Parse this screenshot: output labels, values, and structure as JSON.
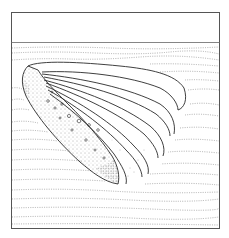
{
  "figure": {
    "type": "scientific line illustration",
    "colors": {
      "background": "#ffffff",
      "frame": "#555555",
      "outline": "#2a2a2a",
      "sediment": "#9a9a9a",
      "stipple": "#6a6a6a"
    },
    "frame": {
      "x": 11,
      "y": 12,
      "width": 209,
      "height": 217
    },
    "horizon_y": 42
  }
}
